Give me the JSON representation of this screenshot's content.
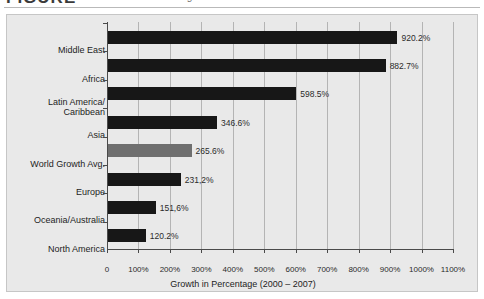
{
  "caption": {
    "label": "FIGURE",
    "subtitle": "Internet growth"
  },
  "chart_data": {
    "type": "bar",
    "orientation": "horizontal",
    "title": "",
    "xlabel": "Growth in Percentage (2000 – 2007)",
    "ylabel": "",
    "categories": [
      "Middle East",
      "Africa",
      "Latin America/ Caribbean",
      "Asia",
      "World Growth Avg.",
      "Europe",
      "Oceania/Australia",
      "North America"
    ],
    "category_lines": [
      [
        "Middle East"
      ],
      [
        "Africa"
      ],
      [
        "Latin America/",
        "Caribbean"
      ],
      [
        "Asia"
      ],
      [
        "World Growth Avg."
      ],
      [
        "Europe"
      ],
      [
        "Oceania/Australia"
      ],
      [
        "North America"
      ]
    ],
    "values": [
      920.2,
      882.7,
      598.5,
      346.6,
      265.6,
      231.2,
      151.6,
      120.2
    ],
    "value_labels": [
      "920.2%",
      "882.7%",
      "598.5%",
      "346.6%",
      "265.6%",
      "231,2%",
      "151,6%",
      "120.2%"
    ],
    "highlight_index": 4,
    "xlim": [
      0,
      1100
    ],
    "xticks": [
      0,
      100,
      200,
      300,
      400,
      500,
      600,
      700,
      800,
      900,
      1000,
      1100
    ],
    "xtick_labels": [
      "0",
      "100%",
      "200%",
      "300%",
      "400%",
      "500%",
      "600%",
      "700%",
      "800%",
      "900%",
      "1000%",
      "1100%"
    ],
    "grid": "vertical",
    "legend": "none",
    "colors": {
      "bar": "#171717",
      "highlight_bar": "#6f6f6f",
      "panel_background": "#e9e9e9",
      "panel_border": "#c6c6c6",
      "gridline": "#b4b4b4",
      "axis": "#4a4a4a",
      "text": "#1d1d1d"
    }
  }
}
